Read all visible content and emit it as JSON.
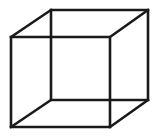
{
  "figure": {
    "type": "wireframe-line-drawing",
    "background_color": "#ffffff",
    "stroke_color": "#1a1a1a",
    "stroke_width": 2.6,
    "canvas": {
      "width": 161,
      "height": 138
    },
    "vertices": {
      "front_top_left": {
        "x": 11,
        "y": 37
      },
      "front_top_right": {
        "x": 110,
        "y": 37
      },
      "front_bottom_right": {
        "x": 110,
        "y": 127
      },
      "front_bottom_left": {
        "x": 11,
        "y": 127
      },
      "back_top_left": {
        "x": 51,
        "y": 10
      },
      "back_top_right": {
        "x": 148,
        "y": 10
      },
      "back_bottom_right": {
        "x": 148,
        "y": 100
      },
      "back_bottom_left": {
        "x": 51,
        "y": 100
      }
    },
    "paths": {
      "front_face": "M11,37 L110,37 L110,127 L11,127 Z",
      "back_face": "M51,10 L148,10 L148,100 L51,100 Z",
      "connector_top_left": "M11,37 L51,10",
      "connector_top_right": "M110,37 L148,10",
      "connector_bottom_right": "M110,127 L148,100",
      "connector_bottom_left": "M11,127 L51,100"
    },
    "edge_count": 12,
    "vertex_count": 8
  }
}
